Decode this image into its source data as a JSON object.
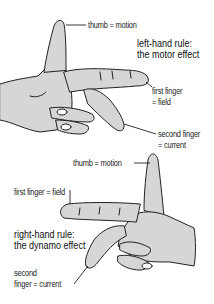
{
  "figure": {
    "colors": {
      "hand_fill": "#d6d6d6",
      "outline": "#222222",
      "background": "#ffffff"
    },
    "left_hand": {
      "title_line1": "left-hand rule:",
      "title_line2": "the motor effect",
      "labels": {
        "thumb": "thumb = motion",
        "first_finger_line1": "first finger",
        "first_finger_line2": "= field",
        "second_finger_line1": "second finger",
        "second_finger_line2": "= current"
      }
    },
    "right_hand": {
      "title_line1": "right-hand rule:",
      "title_line2": "the dynamo effect",
      "labels": {
        "thumb": "thumb = motion",
        "first_finger": "first finger = field",
        "second_finger_line1": "second",
        "second_finger_line2": "finger = current"
      }
    }
  }
}
